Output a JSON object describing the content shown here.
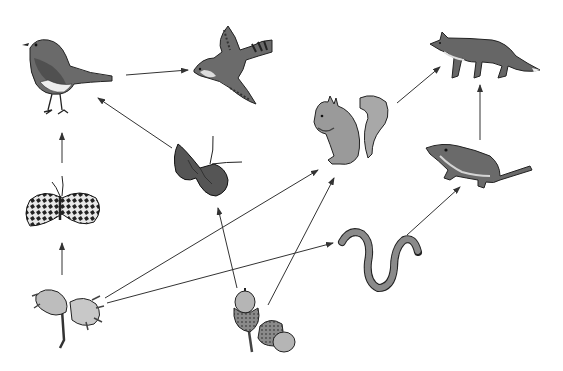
{
  "diagram": {
    "type": "food-web",
    "background": "#ffffff",
    "arrow_color": "#333333",
    "organisms": [
      {
        "id": "robin",
        "name": "Robin",
        "icon": "robin-icon",
        "x": 62,
        "y": 80
      },
      {
        "id": "hawk",
        "name": "Hawk",
        "icon": "hawk-icon",
        "x": 228,
        "y": 70
      },
      {
        "id": "moth",
        "name": "Moth",
        "icon": "moth-icon",
        "x": 62,
        "y": 205
      },
      {
        "id": "butterfly",
        "name": "Butterfly",
        "icon": "butterfly-icon",
        "x": 205,
        "y": 168
      },
      {
        "id": "squirrel",
        "name": "Squirrel",
        "icon": "squirrel-icon",
        "x": 338,
        "y": 130
      },
      {
        "id": "fox",
        "name": "Fox",
        "icon": "fox-icon",
        "x": 483,
        "y": 52
      },
      {
        "id": "shrew",
        "name": "Shrew",
        "icon": "shrew-icon",
        "x": 478,
        "y": 165
      },
      {
        "id": "worm",
        "name": "Earthworm",
        "icon": "earthworm-icon",
        "x": 378,
        "y": 258
      },
      {
        "id": "hazel",
        "name": "Hazel nut",
        "icon": "hazelnut-icon",
        "x": 65,
        "y": 315
      },
      {
        "id": "acorn",
        "name": "Acorns",
        "icon": "acorn-icon",
        "x": 262,
        "y": 322
      }
    ],
    "arrows": [
      {
        "from": "robin",
        "to": "hawk",
        "x1": 126,
        "y1": 75,
        "x2": 188,
        "y2": 70
      },
      {
        "from": "butterfly",
        "to": "robin",
        "x1": 172,
        "y1": 148,
        "x2": 98,
        "y2": 98
      },
      {
        "from": "moth",
        "to": "robin",
        "x1": 62,
        "y1": 163,
        "x2": 62,
        "y2": 133
      },
      {
        "from": "hazel",
        "to": "moth",
        "x1": 62,
        "y1": 275,
        "x2": 62,
        "y2": 243
      },
      {
        "from": "hazel",
        "to": "squirrel",
        "x1": 105,
        "y1": 298,
        "x2": 318,
        "y2": 170
      },
      {
        "from": "hazel",
        "to": "worm",
        "x1": 107,
        "y1": 303,
        "x2": 333,
        "y2": 243
      },
      {
        "from": "acorn",
        "to": "butterfly",
        "x1": 237,
        "y1": 288,
        "x2": 218,
        "y2": 208
      },
      {
        "from": "acorn",
        "to": "squirrel",
        "x1": 268,
        "y1": 305,
        "x2": 334,
        "y2": 178
      },
      {
        "from": "squirrel",
        "to": "fox",
        "x1": 397,
        "y1": 103,
        "x2": 440,
        "y2": 67
      },
      {
        "from": "shrew",
        "to": "fox",
        "x1": 480,
        "y1": 140,
        "x2": 480,
        "y2": 85
      },
      {
        "from": "worm",
        "to": "shrew",
        "x1": 407,
        "y1": 235,
        "x2": 460,
        "y2": 187
      }
    ]
  }
}
